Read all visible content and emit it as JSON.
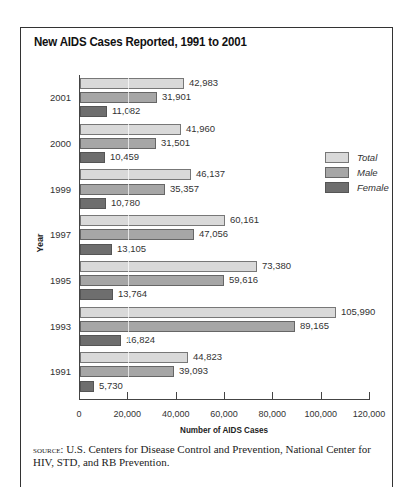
{
  "chart_data": {
    "type": "bar",
    "orientation": "horizontal",
    "title": "New AIDS Cases Reported, 1991 to 2001",
    "xlabel": "Number of AIDS Cases",
    "ylabel": "Year",
    "xlim": [
      0,
      120000
    ],
    "x_ticks": [
      "0",
      "20,000",
      "40,000",
      "60,000",
      "80,000",
      "100,000",
      "120,000"
    ],
    "categories": [
      "2001",
      "2000",
      "1999",
      "1997",
      "1995",
      "1993",
      "1991"
    ],
    "series": [
      {
        "name": "Total",
        "color": "#d9d9d9",
        "values": [
          42983,
          41960,
          46137,
          60161,
          73380,
          105990,
          44823
        ],
        "labels": [
          "42,983",
          "41,960",
          "46,137",
          "60,161",
          "73,380",
          "105,990",
          "44,823"
        ]
      },
      {
        "name": "Male",
        "color": "#a6a6a6",
        "values": [
          31901,
          31501,
          35357,
          47056,
          59616,
          89165,
          39093
        ],
        "labels": [
          "31,901",
          "31,501",
          "35,357",
          "47,056",
          "59,616",
          "89,165",
          "39,093"
        ]
      },
      {
        "name": "Female",
        "color": "#6e6e6e",
        "values": [
          11082,
          10459,
          10780,
          13105,
          13764,
          16824,
          5730
        ],
        "labels": [
          "11,082",
          "10,459",
          "10,780",
          "13,105",
          "13,764",
          "16,824",
          "5,730"
        ]
      }
    ],
    "legend_position": "right",
    "grid": false
  },
  "legend": [
    "Total",
    "Male",
    "Female"
  ],
  "source": {
    "prefix": "source:",
    "text": " U.S. Centers for Disease Control and Prevention, National Center for HIV, STD, and RB Prevention."
  }
}
